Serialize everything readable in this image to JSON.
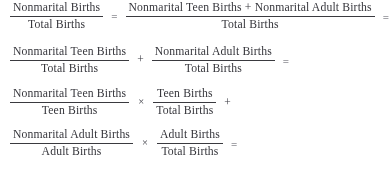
{
  "document": {
    "type": "mathematical-derivation",
    "description": "Decomposition of the nonmarital birth ratio into teen and adult components",
    "text_color": "#36363a",
    "background_color": "#ffffff"
  },
  "terms": {
    "nonmarital_births": "Nonmarital Births",
    "total_births": "Total Births",
    "nonmarital_teen_births": "Nonmarital Teen Births",
    "nonmarital_adult_births": "Nonmarital Adult Births",
    "teen_births": "Teen Births",
    "adult_births": "Adult Births"
  },
  "operators": {
    "equals": "=",
    "plus": "+",
    "times": "×"
  },
  "lines": [
    {
      "id": "line-1",
      "parts": [
        {
          "kind": "fraction",
          "numerator": "Nonmarital Births",
          "denominator": "Total Births"
        },
        {
          "kind": "operator",
          "symbol": "="
        },
        {
          "kind": "fraction",
          "numerator": "Nonmarital Teen Births + Nonmarital Adult Births",
          "denominator": "Total Births"
        },
        {
          "kind": "operator",
          "symbol": "="
        }
      ]
    },
    {
      "id": "line-2",
      "parts": [
        {
          "kind": "fraction",
          "numerator": "Nonmarital Teen Births",
          "denominator": "Total Births"
        },
        {
          "kind": "operator",
          "symbol": "+"
        },
        {
          "kind": "fraction",
          "numerator": "Nonmarital Adult Births",
          "denominator": "Total Births"
        },
        {
          "kind": "operator",
          "symbol": "="
        }
      ]
    },
    {
      "id": "line-3",
      "parts": [
        {
          "kind": "fraction",
          "numerator": "Nonmarital Teen Births",
          "denominator": "Teen Births"
        },
        {
          "kind": "operator",
          "symbol": "×"
        },
        {
          "kind": "fraction",
          "numerator": "Teen Births",
          "denominator": "Total Births"
        },
        {
          "kind": "operator",
          "symbol": "+"
        }
      ]
    },
    {
      "id": "line-4",
      "parts": [
        {
          "kind": "fraction",
          "numerator": "Nonmarital Adult Births",
          "denominator": "Adult Births"
        },
        {
          "kind": "operator",
          "symbol": "×"
        },
        {
          "kind": "fraction",
          "numerator": "Adult Births",
          "denominator": "Total Births"
        },
        {
          "kind": "operator",
          "symbol": "="
        }
      ]
    }
  ]
}
